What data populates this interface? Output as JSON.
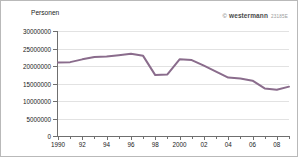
{
  "watermark": {
    "copyright": "©",
    "brand": "westermann",
    "code": "23185E"
  },
  "axis_title": "Personen",
  "chart_data": {
    "type": "line",
    "title": "",
    "subtitle": "",
    "xlabel": "",
    "ylabel": "Personen",
    "grid": true,
    "legend": "none",
    "xlim": [
      1990,
      2009
    ],
    "ylim": [
      0,
      30000000
    ],
    "ytick_values": [
      0,
      5000000,
      10000000,
      15000000,
      20000000,
      25000000,
      30000000
    ],
    "ytick_labels": [
      "0",
      "5000000",
      "10000000",
      "15000000",
      "20000000",
      "25000000",
      "30000000"
    ],
    "xtick_values": [
      1990,
      1992,
      1994,
      1996,
      1998,
      2000,
      2002,
      2004,
      2006,
      2008
    ],
    "xtick_labels": [
      "1990",
      "92",
      "94",
      "96",
      "98",
      "2000",
      "02",
      "04",
      "06",
      "08"
    ],
    "xtick_minor_values": [
      1991,
      1993,
      1995,
      1997,
      1999,
      2001,
      2003,
      2005,
      2007,
      2009
    ],
    "series": [
      {
        "name": "Personen",
        "color": "#8a6c8c",
        "x": [
          1990,
          1991,
          1992,
          1993,
          1994,
          1995,
          1996,
          1997,
          1998,
          1999,
          2000,
          2001,
          2002,
          2003,
          2004,
          2005,
          2006,
          2007,
          2008,
          2009
        ],
        "values": [
          21000000,
          21100000,
          21900000,
          22600000,
          22700000,
          23100000,
          23500000,
          22900000,
          17400000,
          17600000,
          21900000,
          21700000,
          20100000,
          18400000,
          16700000,
          16400000,
          15800000,
          13600000,
          13200000,
          14100000
        ]
      }
    ]
  }
}
